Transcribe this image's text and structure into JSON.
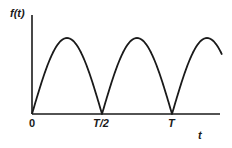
{
  "chart_data": {
    "type": "line",
    "title": "",
    "ylabel": "f(t)",
    "xlabel": "t",
    "function": "|sin(2πt/T)| (full-wave rectified sine)",
    "x_tick_labels": [
      "0",
      "T/2",
      "T"
    ],
    "x_ticks_fraction_of_T": [
      0,
      0.5,
      1.0
    ],
    "x": [
      0,
      0.0625,
      0.125,
      0.1875,
      0.25,
      0.3125,
      0.375,
      0.4375,
      0.5,
      0.5625,
      0.625,
      0.6875,
      0.75,
      0.8125,
      0.875,
      0.9375,
      1.0,
      1.0625,
      1.125,
      1.1875,
      1.25,
      1.3
    ],
    "series": [
      {
        "name": "f(t)",
        "values": [
          0,
          0.38,
          0.71,
          0.92,
          1.0,
          0.92,
          0.71,
          0.38,
          0,
          0.38,
          0.71,
          0.92,
          1.0,
          0.92,
          0.71,
          0.38,
          0,
          0.38,
          0.71,
          0.92,
          1.0,
          0.97
        ]
      }
    ],
    "xlim": [
      0,
      1.35
    ],
    "ylim": [
      0,
      1.3
    ],
    "grid": false,
    "legend": "none",
    "color": "#1a1a1a"
  },
  "labels": {
    "y_axis": "f(t)",
    "x_axis": "t",
    "tick_0": "0",
    "tick_half": "T/2",
    "tick_T": "T"
  },
  "geometry": {
    "origin_x": 32,
    "axis_y": 114,
    "axis_top": 15,
    "axis_right": 220,
    "half_period_px": 70,
    "peak_y": 38
  }
}
